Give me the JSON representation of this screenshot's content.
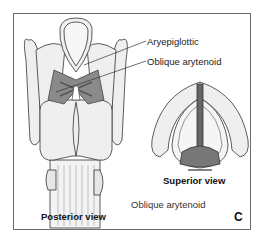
{
  "figure": {
    "panel_letter": "C",
    "callouts": [
      {
        "label": "Aryepiglottic"
      },
      {
        "label": "Oblique arytenoid"
      }
    ],
    "views": {
      "posterior": "Posterior view",
      "superior": "Superior view"
    },
    "caption": "Oblique arytenoid"
  },
  "colors": {
    "border": "#6b6b6b",
    "cartilage": "#efefef",
    "outline": "#333333",
    "muscle": "#7d7d7d",
    "muscle_dark": "#555555"
  }
}
